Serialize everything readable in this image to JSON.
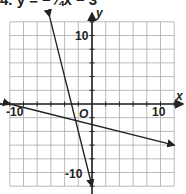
{
  "problem": {
    "number": "4.",
    "equation_text": "y = −¼x − 3"
  },
  "chart_data": {
    "type": "line",
    "title": "",
    "xlabel": "x",
    "ylabel": "y",
    "origin_label": "O",
    "xlim": [
      -12,
      12
    ],
    "ylim": [
      -12,
      12
    ],
    "grid": true,
    "grid_step": 2,
    "tick_labels": {
      "x": [
        "-10",
        "10"
      ],
      "y": [
        "10",
        "-10"
      ]
    },
    "series": [
      {
        "name": "y = -1/4 x - 3",
        "slope": -0.25,
        "intercept": -3,
        "x": [
          -12,
          12
        ],
        "y": [
          0,
          -6
        ]
      },
      {
        "name": "y = -4x - 12",
        "slope": -4,
        "intercept": -12,
        "x": [
          -6.2,
          0
        ],
        "y": [
          12.8,
          -12
        ]
      }
    ],
    "intersection": {
      "x": -2.4,
      "y": -2.4
    }
  }
}
